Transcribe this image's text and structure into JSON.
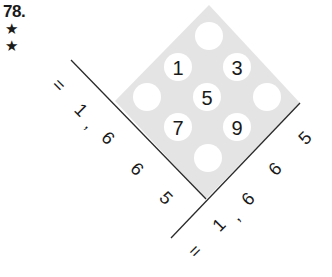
{
  "header": {
    "puzzle_number": "78.",
    "difficulty_stars": [
      "★",
      "★"
    ]
  },
  "grid": {
    "fill_color": "#e4e4e4",
    "cells": [
      {
        "pos": "top",
        "value": ""
      },
      {
        "pos": "upper-left",
        "value": "1"
      },
      {
        "pos": "upper-right",
        "value": "3"
      },
      {
        "pos": "left",
        "value": ""
      },
      {
        "pos": "center",
        "value": "5"
      },
      {
        "pos": "right",
        "value": ""
      },
      {
        "pos": "lower-left",
        "value": "7"
      },
      {
        "pos": "lower-right",
        "value": "9"
      },
      {
        "pos": "bottom",
        "value": ""
      }
    ]
  },
  "left_sum": {
    "chars": [
      "=",
      "1",
      ",",
      "6",
      "6",
      "5"
    ],
    "text": "= 1,665"
  },
  "right_sum": {
    "chars": [
      "=",
      "1",
      ",",
      "6",
      "6",
      "5"
    ],
    "text": "= 1,665"
  }
}
